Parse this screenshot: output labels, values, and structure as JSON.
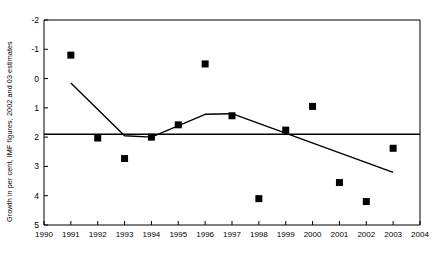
{
  "chart_data": {
    "type": "scatter",
    "title": "",
    "xlabel": "",
    "ylabel": "Growth in per cent, IMF figures, 2002 and 03 estimates",
    "xlim": [
      1990,
      2004
    ],
    "ylim": [
      -2,
      5
    ],
    "xticks": [
      1990,
      1991,
      1992,
      1993,
      1994,
      1995,
      1996,
      1997,
      1998,
      1999,
      2000,
      2001,
      2002,
      2003,
      2004
    ],
    "yticks": [
      -2,
      -1,
      0,
      1,
      2,
      3,
      4,
      5
    ],
    "grid": false,
    "legend": "none",
    "series": [
      {
        "name": "Annual growth",
        "type": "scatter",
        "marker": "square",
        "color": "#000000",
        "x": [
          1991,
          1992,
          1993,
          1994,
          1995,
          1996,
          1997,
          1998,
          1999,
          2000,
          2001,
          2002,
          2003
        ],
        "values": [
          3.8,
          0.97,
          0.27,
          1.0,
          1.42,
          3.5,
          1.73,
          -1.1,
          1.24,
          2.05,
          -0.55,
          -1.2,
          0.62
        ]
      },
      {
        "name": "Trend line",
        "type": "line",
        "color": "#000000",
        "x": [
          1991,
          1993,
          1994,
          1996,
          1997,
          2003
        ],
        "values": [
          2.85,
          1.05,
          1.0,
          1.78,
          1.8,
          -0.2
        ]
      },
      {
        "name": "Reference line",
        "type": "line",
        "color": "#000000",
        "x": [
          1990,
          2004
        ],
        "values": [
          1.1,
          1.1
        ]
      }
    ]
  },
  "axis": {
    "y_label_text": "Growth in per cent, IMF figures, 2002 and 03 estimates",
    "y_tick_texts": [
      "5",
      "4",
      "3",
      "2",
      "1",
      "0",
      "-1",
      "-2"
    ],
    "x_tick_texts": [
      "1990",
      "1991",
      "1992",
      "1993",
      "1994",
      "1995",
      "1996",
      "1997",
      "1998",
      "1999",
      "2000",
      "2001",
      "2002",
      "2003",
      "2004"
    ]
  }
}
